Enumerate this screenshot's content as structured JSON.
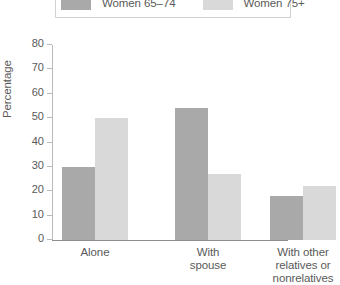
{
  "legend": {
    "entries": [
      {
        "label": "Women 65–74",
        "swatch_name": "legend-swatch-women-65-74",
        "color": "#a9a9a9"
      },
      {
        "label": "Women 75+",
        "swatch_name": "legend-swatch-women-75-plus",
        "color": "#d9d9d9"
      }
    ]
  },
  "axes": {
    "ylabel": "Percentage",
    "yticks": [
      "0",
      "10",
      "20",
      "30",
      "40",
      "50",
      "60",
      "70",
      "80"
    ]
  },
  "categories": [
    {
      "lines": [
        "Alone"
      ]
    },
    {
      "lines": [
        "With",
        "spouse"
      ]
    },
    {
      "lines": [
        "With other",
        "relatives or",
        "nonrelatives"
      ]
    }
  ],
  "chart_data": {
    "type": "bar",
    "title": "",
    "xlabel": "",
    "ylabel": "Percentage",
    "ylim": [
      0,
      80
    ],
    "ytick_step": 10,
    "grid": false,
    "legend_position": "top",
    "categories": [
      "Alone",
      "With spouse",
      "With other relatives or nonrelatives"
    ],
    "series": [
      {
        "name": "Women 65–74",
        "color": "#a9a9a9",
        "values": [
          30,
          54,
          18
        ]
      },
      {
        "name": "Women 75+",
        "color": "#d9d9d9",
        "values": [
          50,
          27,
          22
        ]
      }
    ]
  }
}
